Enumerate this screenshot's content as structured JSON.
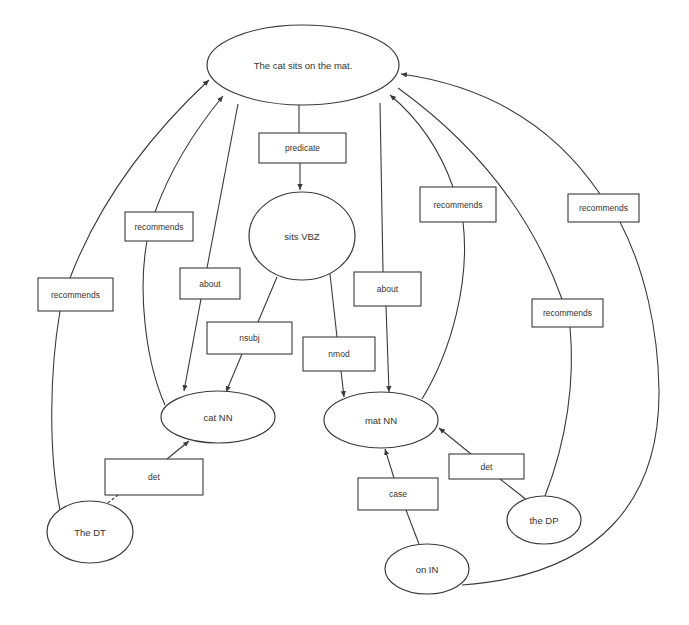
{
  "diagram": {
    "type": "dependency-graph",
    "colors": {
      "stroke": "#3a3a3a",
      "text": "#333333",
      "background": "#ffffff"
    },
    "nodes": [
      {
        "id": "root",
        "label": "The cat sits on the mat.",
        "cx": 303,
        "cy": 65,
        "rx": 96,
        "ry": 40
      },
      {
        "id": "sits",
        "label": "sits VBZ",
        "cx": 302,
        "cy": 236,
        "rx": 53,
        "ry": 44
      },
      {
        "id": "cat",
        "label": "cat NN",
        "cx": 218,
        "cy": 417,
        "rx": 57,
        "ry": 26
      },
      {
        "id": "mat",
        "label": "mat NN",
        "cx": 381,
        "cy": 420,
        "rx": 57,
        "ry": 28
      },
      {
        "id": "the_dt",
        "label": "The DT",
        "cx": 90,
        "cy": 532,
        "rx": 43,
        "ry": 31
      },
      {
        "id": "the_dp",
        "label": "the DP",
        "cx": 544,
        "cy": 520,
        "rx": 37,
        "ry": 24
      },
      {
        "id": "on_in",
        "label": "on IN",
        "cx": 427,
        "cy": 569,
        "rx": 42,
        "ry": 25
      }
    ],
    "edge_labels": [
      {
        "id": "predicate",
        "label": "predicate",
        "x": 259,
        "y": 133,
        "w": 87,
        "h": 30
      },
      {
        "id": "rec_left_outer",
        "label": "recommends",
        "x": 38,
        "y": 278,
        "w": 75,
        "h": 33
      },
      {
        "id": "rec_left_inner",
        "label": "recommends",
        "x": 125,
        "y": 212,
        "w": 68,
        "h": 29
      },
      {
        "id": "about_left",
        "label": "about",
        "x": 180,
        "y": 268,
        "w": 60,
        "h": 31
      },
      {
        "id": "nsubj",
        "label": "nsubj",
        "x": 207,
        "y": 322,
        "w": 85,
        "h": 32
      },
      {
        "id": "nmod",
        "label": "nmod",
        "x": 303,
        "y": 337,
        "w": 72,
        "h": 34
      },
      {
        "id": "about_right",
        "label": "about",
        "x": 354,
        "y": 272,
        "w": 67,
        "h": 34
      },
      {
        "id": "rec_mid_right",
        "label": "recommends",
        "x": 420,
        "y": 187,
        "w": 76,
        "h": 35
      },
      {
        "id": "rec_far_right",
        "label": "recommends",
        "x": 568,
        "y": 194,
        "w": 71,
        "h": 28
      },
      {
        "id": "rec_dp",
        "label": "recommends",
        "x": 532,
        "y": 299,
        "w": 71,
        "h": 28
      },
      {
        "id": "det_left",
        "label": "det",
        "x": 105,
        "y": 459,
        "w": 98,
        "h": 36
      },
      {
        "id": "det_right",
        "label": "det",
        "x": 449,
        "y": 454,
        "w": 75,
        "h": 25
      },
      {
        "id": "case",
        "label": "case",
        "x": 358,
        "y": 478,
        "w": 80,
        "h": 32
      }
    ],
    "edges": [
      {
        "from": "root",
        "to": "sits",
        "via": "predicate"
      },
      {
        "from": "sits",
        "to": "cat",
        "via": "nsubj"
      },
      {
        "from": "sits",
        "to": "mat",
        "via": "nmod"
      },
      {
        "from": "root",
        "to": "cat",
        "via": "about_left"
      },
      {
        "from": "root",
        "to": "mat",
        "via": "about_right"
      },
      {
        "from": "cat",
        "to": "root",
        "via": "rec_left_inner"
      },
      {
        "from": "the_dt",
        "to": "root",
        "via": "rec_left_outer"
      },
      {
        "from": "mat",
        "to": "root",
        "via": "rec_mid_right"
      },
      {
        "from": "the_dp",
        "to": "root",
        "via": "rec_dp"
      },
      {
        "from": "on_in",
        "to": "root",
        "via": "rec_far_right"
      },
      {
        "from": "the_dt",
        "to": "cat",
        "via": "det_left"
      },
      {
        "from": "the_dp",
        "to": "mat",
        "via": "det_right"
      },
      {
        "from": "on_in",
        "to": "mat",
        "via": "case"
      }
    ]
  }
}
